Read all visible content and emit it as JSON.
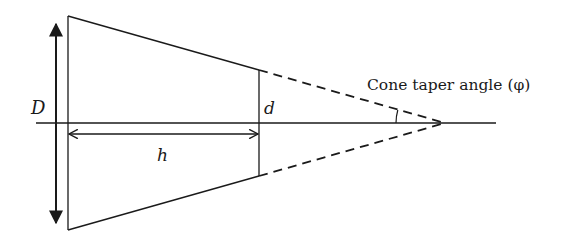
{
  "diagram": {
    "type": "cone-frustum-geometry",
    "labels": {
      "large_diameter": "D",
      "small_diameter": "d",
      "height": "h",
      "taper_angle": "Cone taper angle (φ)"
    },
    "colors": {
      "stroke": "#1a1a1a",
      "background": "#ffffff"
    },
    "geometry": {
      "axis": {
        "x1": 36,
        "x2": 496,
        "y": 123
      },
      "large_end": {
        "x": 68,
        "y_top": 16,
        "y_bottom": 230
      },
      "small_end": {
        "x": 259,
        "y_top": 70,
        "y_bottom": 176
      },
      "apex": {
        "x": 445,
        "y": 123
      },
      "D_arrow": {
        "x": 56,
        "y_top": 15,
        "y_bottom": 232
      },
      "h_arrow": {
        "x1": 68,
        "x2": 259,
        "y": 134
      }
    }
  }
}
